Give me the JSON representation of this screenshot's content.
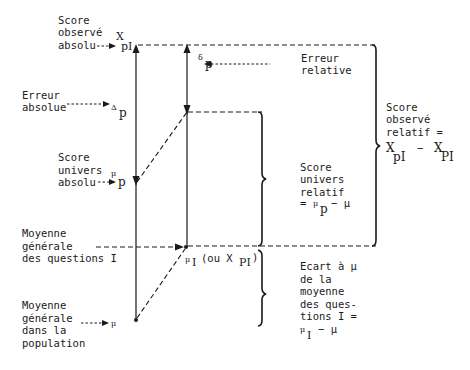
{
  "diagram": {
    "labels": {
      "observed_absolute": [
        "Score",
        "observé",
        "absolu"
      ],
      "absolute_error": [
        "Erreur",
        "absolue"
      ],
      "universe_absolute": [
        "Score",
        "univers",
        "absolu"
      ],
      "mean_questions": [
        "Moyenne",
        "générale",
        "des questions I"
      ],
      "population_mean": [
        "Moyenne",
        "générale",
        "dans la",
        "population"
      ],
      "relative_error": [
        "Erreur",
        "relative"
      ],
      "universe_relative": [
        "Score",
        "univers",
        "relatif"
      ],
      "universe_relative_formula": "= μ_p − μ",
      "observed_relative": [
        "Score",
        "observé",
        "relatif ="
      ],
      "observed_relative_formula": "X_pI − X_PI",
      "deviation": [
        "Ecart à μ",
        "de la",
        "moyenne",
        "des ques-",
        "tions I ="
      ],
      "deviation_formula": "μ_I − μ"
    },
    "symbols": {
      "X_pI": {
        "base": "X",
        "sub": "pI"
      },
      "Delta_p": {
        "base": "Δ",
        "sub": "p"
      },
      "mu_p": {
        "base": "μ",
        "sub": "p"
      },
      "delta_p": {
        "base": "δ",
        "sub": "p"
      },
      "mu_I": {
        "base": "μ",
        "sub": "I",
        "suffix": "(ou X",
        "suffix_sub": "PI",
        "suffix_end": ")"
      },
      "mu": {
        "base": "μ"
      },
      "relative_formula_mu": "μ",
      "relative_formula_sub": "p",
      "relative_formula_rest": "− μ",
      "observed_formula_a": "X",
      "observed_formula_a_sub": "pI",
      "observed_formula_minus": "−",
      "observed_formula_b": "X",
      "observed_formula_b_sub": "PI",
      "deviation_formula_mu": "μ",
      "deviation_formula_sub": "I",
      "deviation_formula_rest": "−  μ",
      "eq": "="
    }
  }
}
